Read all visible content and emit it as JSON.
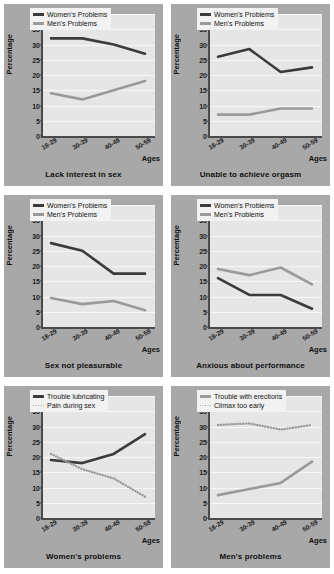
{
  "figure": {
    "panel_bg": "#a8a8a8",
    "plot_bg": "#e6e6e6",
    "women_color": "#3b3b3b",
    "men_color": "#9a9a9a",
    "axis_color": "#4a4a4a"
  },
  "axes": {
    "ylabel": "Percentage",
    "xlabel": "Ages",
    "yticks": [
      "0",
      "5",
      "10",
      "15",
      "20",
      "25",
      "30",
      "35",
      "40"
    ],
    "ylim": [
      0,
      40
    ],
    "categories": [
      "18-29",
      "30-39",
      "40-49",
      "50-59"
    ]
  },
  "chart_data": [
    {
      "type": "line",
      "title": "Lack interest in sex",
      "xlabel": "Ages",
      "ylabel": "Percentage",
      "ylim": [
        0,
        40
      ],
      "grid": true,
      "legend_position": "top-center",
      "categories": [
        "18-29",
        "30-39",
        "40-49",
        "50-59"
      ],
      "series": [
        {
          "name": "Women's Problems",
          "values": [
            32,
            32,
            30,
            27
          ],
          "style": "solid",
          "color": "#3b3b3b"
        },
        {
          "name": "Men's Problems",
          "values": [
            14,
            12,
            15,
            18
          ],
          "style": "solid",
          "color": "#9a9a9a"
        }
      ]
    },
    {
      "type": "line",
      "title": "Unable to achieve orgasm",
      "xlabel": "Ages",
      "ylabel": "Percentage",
      "ylim": [
        0,
        40
      ],
      "grid": true,
      "legend_position": "top-center",
      "categories": [
        "18-29",
        "30-39",
        "40-49",
        "50-59"
      ],
      "series": [
        {
          "name": "Women's Problems",
          "values": [
            26,
            28.5,
            21,
            22.5
          ],
          "style": "solid",
          "color": "#3b3b3b"
        },
        {
          "name": "Men's Problems",
          "values": [
            7,
            7,
            9,
            9
          ],
          "style": "solid",
          "color": "#9a9a9a"
        }
      ]
    },
    {
      "type": "line",
      "title": "Sex not pleasurable",
      "xlabel": "Ages",
      "ylabel": "Percentage",
      "ylim": [
        0,
        40
      ],
      "grid": true,
      "legend_position": "top-center",
      "categories": [
        "18-29",
        "30-39",
        "40-49",
        "50-59"
      ],
      "series": [
        {
          "name": "Women's Problems",
          "values": [
            27.5,
            25,
            17.5,
            17.5
          ],
          "style": "solid",
          "color": "#3b3b3b"
        },
        {
          "name": "Men's Problems",
          "values": [
            9.5,
            7.5,
            8.5,
            5.5
          ],
          "style": "solid",
          "color": "#9a9a9a"
        }
      ]
    },
    {
      "type": "line",
      "title": "Anxious about performance",
      "xlabel": "Ages",
      "ylabel": "Percentage",
      "ylim": [
        0,
        40
      ],
      "grid": true,
      "legend_position": "top-center",
      "categories": [
        "18-29",
        "30-39",
        "40-49",
        "50-59"
      ],
      "series": [
        {
          "name": "Women's Problems",
          "values": [
            16,
            10.5,
            10.5,
            6
          ],
          "style": "solid",
          "color": "#3b3b3b"
        },
        {
          "name": "Men's Problems",
          "values": [
            19,
            17,
            19.5,
            14
          ],
          "style": "solid",
          "color": "#9a9a9a"
        }
      ]
    },
    {
      "type": "line",
      "title": "Women's problems",
      "xlabel": "Ages",
      "ylabel": "Percentage",
      "ylim": [
        0,
        40
      ],
      "grid": true,
      "legend_position": "top-center",
      "categories": [
        "18-29",
        "30-39",
        "40-49",
        "50-59"
      ],
      "series": [
        {
          "name": "Trouble lubricating",
          "values": [
            19,
            18,
            21,
            27.5
          ],
          "style": "solid",
          "color": "#3b3b3b"
        },
        {
          "name": "Pain during sex",
          "values": [
            21,
            16,
            13,
            7
          ],
          "style": "dotted",
          "color": "#9a9a9a"
        }
      ]
    },
    {
      "type": "line",
      "title": "Men's problems",
      "xlabel": "Ages",
      "ylabel": "Percentage",
      "ylim": [
        0,
        40
      ],
      "grid": true,
      "legend_position": "top-center",
      "categories": [
        "18-29",
        "30-39",
        "40-49",
        "50-59"
      ],
      "series": [
        {
          "name": "Trouble with erections",
          "values": [
            7.5,
            9.5,
            11.5,
            18.5
          ],
          "style": "solid",
          "color": "#9a9a9a"
        },
        {
          "name": "Climax too early",
          "values": [
            30.5,
            31,
            29,
            30.5
          ],
          "style": "dotted",
          "color": "#9a9a9a"
        }
      ]
    }
  ]
}
